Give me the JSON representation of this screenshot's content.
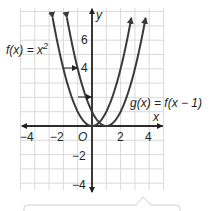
{
  "chart_data": {
    "type": "line",
    "title": "",
    "xlabel": "x",
    "ylabel": "y",
    "xlim": [
      -5,
      5
    ],
    "ylim": [
      -4.5,
      8.2
    ],
    "grid": true,
    "x_ticks": [
      "-4",
      "-2",
      "2",
      "4"
    ],
    "y_ticks": [
      "6",
      "4",
      "-2",
      "-4"
    ],
    "origin_label": "O",
    "series": [
      {
        "name": "f(x) = x^2",
        "formula": "x^2",
        "vertex": [
          0,
          0
        ],
        "points": [
          [
            -2.8,
            7.84
          ],
          [
            -2,
            4
          ],
          [
            -1,
            1
          ],
          [
            0,
            0
          ],
          [
            1,
            1
          ],
          [
            2,
            4
          ],
          [
            2.8,
            7.84
          ]
        ]
      },
      {
        "name": "g(x) = f(x - 1)",
        "formula": "(x-1)^2",
        "vertex": [
          1,
          0
        ],
        "points": [
          [
            -1.8,
            7.84
          ],
          [
            -1,
            4
          ],
          [
            0,
            1
          ],
          [
            1,
            0
          ],
          [
            2,
            1
          ],
          [
            3,
            4
          ],
          [
            3.8,
            7.84
          ]
        ]
      }
    ],
    "annotations": [
      {
        "type": "arrow",
        "from": [
          -2,
          4
        ],
        "to": [
          -1,
          4
        ],
        "meaning": "horizontal shift right 1"
      },
      {
        "type": "arrow",
        "from": [
          -1,
          1
        ],
        "to": [
          0,
          1
        ],
        "meaning": "horizontal shift right 1"
      }
    ]
  },
  "labels": {
    "f_label_main": "f(x) = x",
    "f_label_exp": "2",
    "g_label": "g(x) = f(x − 1)",
    "x_axis": "x",
    "y_axis": "y",
    "origin": "O",
    "tick_x_m4": "−4",
    "tick_x_m2": "−2",
    "tick_x_2": "2",
    "tick_x_4": "4",
    "tick_y_6": "6",
    "tick_y_4": "4",
    "tick_y_m2": "−2",
    "tick_y_m4": "−4"
  },
  "colors": {
    "curve": "#3a3a3a",
    "grid": "#d9d9d9",
    "axis": "#231f20"
  }
}
